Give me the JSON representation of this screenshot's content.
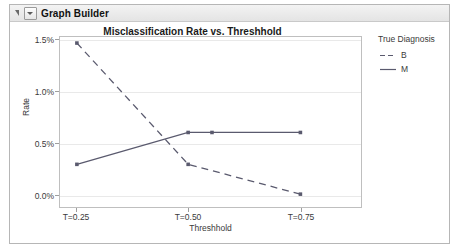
{
  "window": {
    "panel_title": "Graph Builder",
    "disclosure_icon": "triangle-collapse-icon",
    "menu_icon": "red-triangle-menu-icon"
  },
  "chart_data": {
    "type": "line",
    "title": "Misclassification Rate vs. Threshhold",
    "xlabel": "Threshhold",
    "ylabel": "Rate",
    "categories": [
      "T=0.25",
      "T=0.50",
      "T=0.75"
    ],
    "x": [
      0.25,
      0.5,
      0.75
    ],
    "ylim": [
      0.0,
      1.6
    ],
    "yticks": [
      "0.0%",
      "0.5%",
      "1.0%",
      "1.5%"
    ],
    "ytickvalues": [
      0.0,
      0.5,
      1.0,
      1.5
    ],
    "grid": true,
    "legend_position": "right",
    "legend_title": "True Diagnosis",
    "series": [
      {
        "name": "B",
        "style": "dashed",
        "color": "#5a5a6e",
        "values": [
          1.47,
          0.29,
          0.0
        ]
      },
      {
        "name": "M",
        "style": "solid",
        "color": "#5a5a6e",
        "values": [
          0.29,
          0.6,
          0.6
        ]
      }
    ]
  }
}
